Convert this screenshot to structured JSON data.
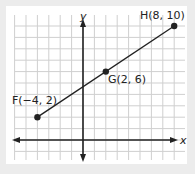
{
  "chart_data": {
    "type": "line",
    "title": "",
    "xlabel": "x",
    "ylabel": "y",
    "xlim": [
      -6,
      9
    ],
    "ylim": [
      -2,
      11
    ],
    "grid": true,
    "points": [
      {
        "name": "F",
        "x": -4,
        "y": 2,
        "label": "F(−4, 2)"
      },
      {
        "name": "G",
        "x": 2,
        "y": 6,
        "label": "G(2, 6)"
      },
      {
        "name": "H",
        "x": 8,
        "y": 10,
        "label": "H(8, 10)"
      }
    ],
    "segments": [
      {
        "from": "F",
        "to": "H"
      }
    ]
  },
  "axes": {
    "x_label": "x",
    "y_label": "y"
  },
  "labels": {
    "F": "F(−4, 2)",
    "G": "G(2, 6)",
    "H": "H(8, 10)"
  },
  "colors": {
    "grid": "#c8c8c8",
    "axis": "#222222",
    "line": "#222222",
    "point": "#222222",
    "background": "#ececec",
    "panel": "#ffffff"
  }
}
